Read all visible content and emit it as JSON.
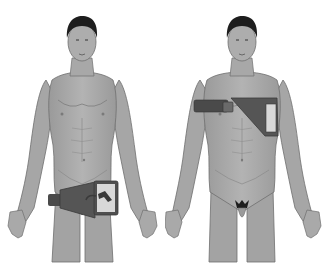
{
  "illustration": {
    "description": "Two male anatomical figures, front view",
    "figures": [
      {
        "id": "left",
        "label": "Figure with device pouch worn at lower abdomen/hip",
        "device_location": "lower abdomen / groin"
      },
      {
        "id": "right",
        "label": "Figure with device pouch worn across upper chest/shoulder",
        "device_location": "upper chest / shoulder"
      }
    ],
    "colors": {
      "skin": "#a9a9a9",
      "skin_shadow": "#8a8a8a",
      "skin_highlight": "#c4c4c4",
      "hair": "#1e1e1e",
      "device_body": "#555555",
      "device_strap": "#4a4a4a",
      "device_window": "#d8d8d8",
      "background": "#ffffff"
    }
  }
}
